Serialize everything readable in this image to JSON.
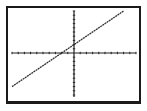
{
  "chart_data": {
    "type": "line",
    "title": "",
    "xlabel": "",
    "ylabel": "",
    "xlim": [
      -10,
      10
    ],
    "ylim": [
      -10,
      10
    ],
    "grid": false,
    "x_ticks_per_side": 10,
    "y_ticks_per_side": 10,
    "series": [
      {
        "name": "y = x + 2",
        "x": [
          -10,
          8
        ],
        "values": [
          -8,
          10
        ]
      }
    ]
  },
  "colors": {
    "frame": "#1a1a1a",
    "axes": "#222222",
    "line": "#333333",
    "background": "#ffffff"
  }
}
